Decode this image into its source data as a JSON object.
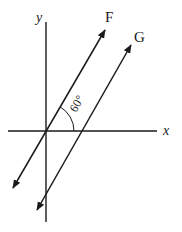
{
  "diagram": {
    "type": "vector-diagram",
    "colors": {
      "line": "#1a1a1a",
      "background": "#ffffff"
    },
    "axes": {
      "x_label": "x",
      "y_label": "y"
    },
    "vectors": [
      {
        "name": "F",
        "label": "F",
        "angle_deg": 60,
        "through_origin": true
      },
      {
        "name": "G",
        "label": "G",
        "angle_deg": 60,
        "through_origin": false
      }
    ],
    "angle": {
      "label": "60°",
      "between": [
        "x-axis",
        "F"
      ]
    }
  }
}
